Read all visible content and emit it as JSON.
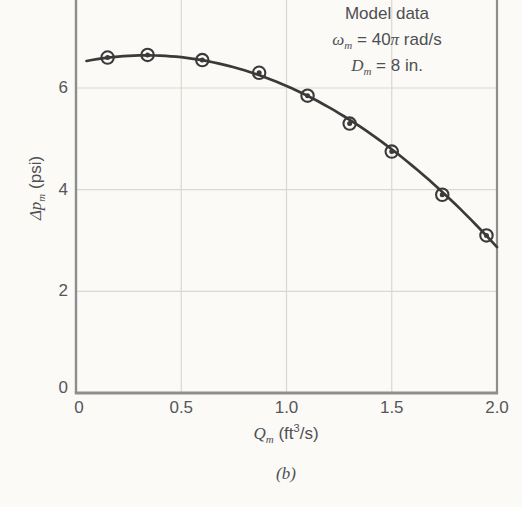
{
  "figure": {
    "caption": "(b)"
  },
  "annotation": {
    "line1": "Model data",
    "line2": {
      "symbol": "ω",
      "sub": "m",
      "mid": " = 40",
      "pi": "π",
      "tail": " rad/s"
    },
    "line3": {
      "symbol": "D",
      "sub": "m",
      "tail": " = 8 in."
    }
  },
  "axes": {
    "y_label": {
      "symbol": "Δp",
      "sub": "m",
      "unit": " (psi)"
    },
    "x_label": {
      "symbol": "Q",
      "sub": "m",
      "unit_open": " (ft",
      "unit_sup": "3",
      "unit_close": "/s)"
    }
  },
  "chart_data": {
    "type": "scatter",
    "title": "",
    "xlabel": "Q_m (ft^3/s)",
    "ylabel": "Δp_m (psi)",
    "xlim": [
      0,
      2.0
    ],
    "ylim_visible": [
      0,
      7.7
    ],
    "x_ticks": [
      0,
      0.5,
      1.0,
      1.5,
      2.0
    ],
    "x_tick_labels": [
      "0",
      "0.5",
      "1.0",
      "1.5",
      "2.0"
    ],
    "y_ticks": [
      0,
      2,
      4,
      6
    ],
    "y_tick_labels": [
      "0",
      "2",
      "4",
      "6"
    ],
    "grid": true,
    "legend_position": "none",
    "series": [
      {
        "name": "Model data",
        "marker": "circle-dot",
        "points": [
          [
            0.15,
            6.6
          ],
          [
            0.34,
            6.65
          ],
          [
            0.6,
            6.55
          ],
          [
            0.87,
            6.3
          ],
          [
            1.1,
            5.85
          ],
          [
            1.3,
            5.3
          ],
          [
            1.5,
            4.75
          ],
          [
            1.74,
            3.9
          ],
          [
            1.95,
            3.1
          ]
        ]
      }
    ],
    "trend_curve": {
      "type": "quadratic",
      "a": 6.49,
      "b": 0.91,
      "c": -1.36,
      "x_start": 0.05,
      "x_end": 2.0
    },
    "annotation_lines": [
      "Model data",
      "ωm = 40π rad/s",
      "Dm = 8 in."
    ]
  },
  "colors": {
    "paper": "#fbfaf7",
    "curve": "#3a3a3a",
    "marker": "#3a3a3a",
    "axis": "#8e8e8e",
    "grid": "#d9d8d2",
    "text": "#4e4f53"
  }
}
